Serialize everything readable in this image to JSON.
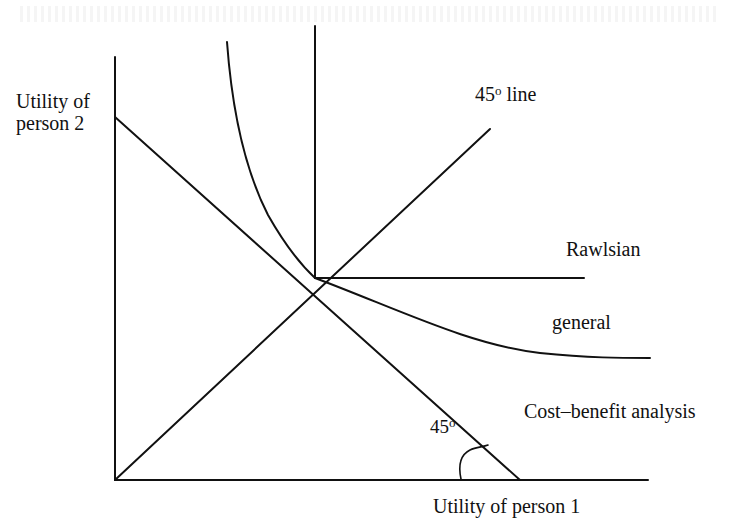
{
  "diagram": {
    "axes": {
      "y_label_line1": "Utility of",
      "y_label_line2": "person 2",
      "x_label": "Utility of person 1"
    },
    "lines": {
      "forty_five_line_num": "45",
      "forty_five_line_sup": "o",
      "forty_five_line_word": " line",
      "rawlsian": "Rawlsian",
      "general": "general",
      "cost_benefit": "Cost–benefit analysis"
    },
    "angle_marker": {
      "num": "45",
      "sup": "o"
    },
    "colors": {
      "line": "#111111",
      "background": "#ffffff"
    }
  }
}
